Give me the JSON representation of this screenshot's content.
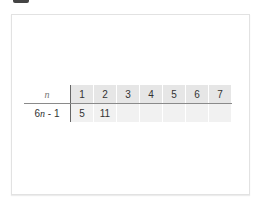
{
  "table": {
    "header_label": "n",
    "row_label": {
      "prefix": "6",
      "var": "n",
      "suffix": " - 1"
    },
    "columns": [
      "1",
      "2",
      "3",
      "4",
      "5",
      "6",
      "7"
    ],
    "values": [
      "5",
      "11",
      "",
      "",
      "",
      "",
      ""
    ]
  }
}
